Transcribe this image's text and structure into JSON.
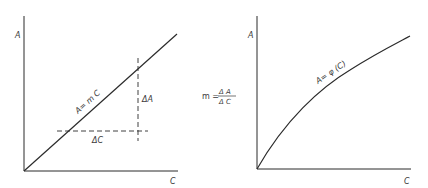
{
  "left_plot": {
    "y_axis_label": "A",
    "x_axis_label": "C",
    "line_label": "A= m C",
    "delta_a_label": "ΔA",
    "delta_c_label": "ΔC",
    "line_type": "linear"
  },
  "formula": {
    "lhs": "m =",
    "numerator": "Δ A",
    "denominator": "Δ C"
  },
  "right_plot": {
    "y_axis_label": "A",
    "x_axis_label": "C",
    "curve_label": "A= φ (C)",
    "line_type": "concave curve"
  },
  "colors": {
    "stroke": "#2b2b2b",
    "text": "#3a3a3a",
    "background": "#ffffff"
  }
}
